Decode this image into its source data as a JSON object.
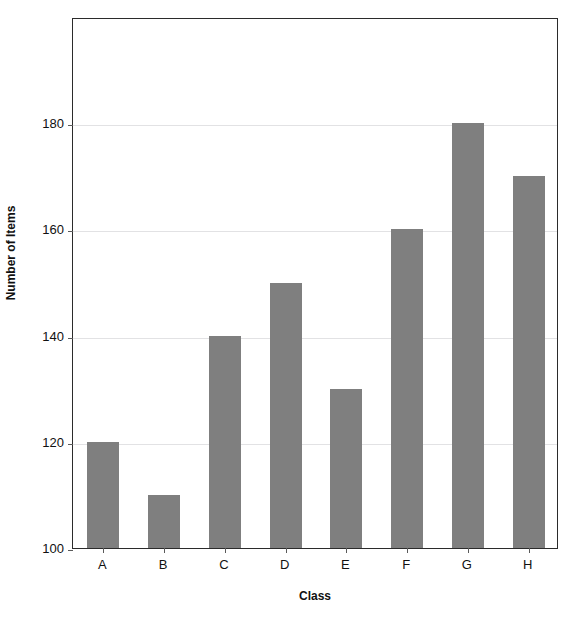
{
  "chart_data": {
    "type": "bar",
    "title": "",
    "xlabel": "Class",
    "ylabel": "Number of Items",
    "categories": [
      "A",
      "B",
      "C",
      "D",
      "E",
      "F",
      "G",
      "H"
    ],
    "values": [
      120,
      110,
      140,
      150,
      130,
      160,
      180,
      170
    ],
    "ylim": [
      100,
      200
    ],
    "yticks": [
      100,
      120,
      140,
      160,
      180
    ],
    "ytick_labels": [
      "100",
      "120",
      "140",
      "160",
      "180"
    ],
    "grid": true,
    "grid_axis": "y",
    "legend": false,
    "bar_color": "#7f7f7f",
    "plot_border_color": "#2b2b2b",
    "gridline_color": "#e2e2e4",
    "background_color": "#ffffff"
  },
  "axes": {
    "y_title": "Number of Items",
    "x_title": "Class"
  },
  "series_label": "Number of Items"
}
